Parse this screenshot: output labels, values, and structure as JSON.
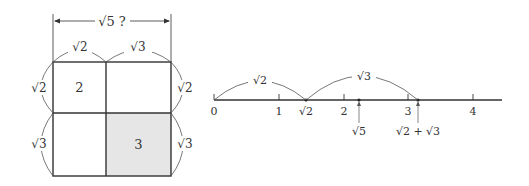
{
  "left_figure": {
    "top_dimension_label": "√5 ?",
    "top_left_width": "√2",
    "top_right_width": "√3",
    "left_top_height": "√2",
    "left_bottom_height": "√3",
    "right_top_height": "√2",
    "right_bottom_height": "√3",
    "cells": [
      {
        "label": "2",
        "shaded": false
      },
      {
        "label": "",
        "shaded": false
      },
      {
        "label": "",
        "shaded": false
      },
      {
        "label": "3",
        "shaded": true
      }
    ],
    "colors": {
      "shade": "#e6e6e6",
      "stroke": "#333333"
    }
  },
  "number_line": {
    "ticks": [
      {
        "label": "0",
        "value": 0
      },
      {
        "label": "1",
        "value": 1
      },
      {
        "label": "2",
        "value": 2
      },
      {
        "label": "3",
        "value": 3
      },
      {
        "label": "4",
        "value": 4
      }
    ],
    "points": [
      {
        "label": "√2",
        "value": 1.414
      },
      {
        "label": "√5",
        "value": 2.236
      },
      {
        "label": "√2 + √3",
        "value": 3.146
      }
    ],
    "arcs": [
      {
        "label": "√2",
        "from": 0,
        "to": 1.414
      },
      {
        "label": "√3",
        "from": 1.414,
        "to": 3.146
      }
    ]
  }
}
